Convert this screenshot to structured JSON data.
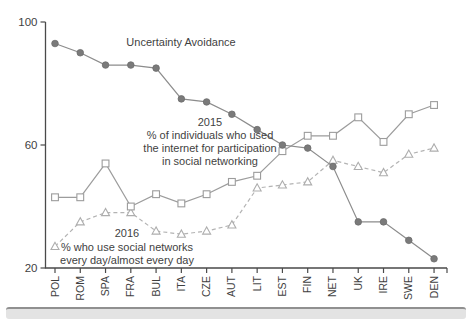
{
  "chart_data": {
    "type": "line",
    "title": "",
    "xlabel": "",
    "ylabel": "",
    "ylim": [
      20,
      100
    ],
    "yticks": [
      20,
      60,
      100
    ],
    "grid": false,
    "legend_position": "inline-annotations",
    "categories": [
      "POL",
      "ROM",
      "SPA",
      "FRA",
      "BUL",
      "ITA",
      "CZE",
      "AUT",
      "LIT",
      "EST",
      "FIN",
      "NET",
      "UK",
      "IRE",
      "SWE",
      "DEN"
    ],
    "series": [
      {
        "name": "Uncertainty Avoidance",
        "marker": "circle-filled",
        "line_style": "solid",
        "line_color": "#8c8c8c",
        "marker_color": "#7a7a7a",
        "values": [
          93,
          90,
          86,
          86,
          85,
          75,
          74,
          70,
          65,
          60,
          59,
          53,
          35,
          35,
          29,
          23
        ]
      },
      {
        "name": "2015 % of individuals who used the internet for participation in social networking",
        "marker": "square-open",
        "line_style": "solid",
        "line_color": "#9c9c9c",
        "marker_color": "#9c9c9c",
        "values": [
          43,
          43,
          54,
          40,
          44,
          41,
          44,
          48,
          50,
          58,
          63,
          63,
          69,
          61,
          70,
          73
        ]
      },
      {
        "name": "2016 % who use social networks every day/almost every day",
        "marker": "triangle-open",
        "line_style": "dashed",
        "line_color": "#b3b3b3",
        "marker_color": "#adadad",
        "values": [
          27,
          35,
          38,
          38,
          32,
          31,
          32,
          34,
          46,
          47,
          48,
          55,
          53,
          51,
          57,
          59
        ]
      }
    ],
    "annotations": [
      {
        "lines": [
          "Uncertainty Avoidance"
        ],
        "x": 181,
        "y": 46,
        "line_height": 13
      },
      {
        "lines": [
          "2015",
          "% of individuals who used",
          "the internet for participation",
          "in social networking"
        ],
        "x": 210,
        "y": 126,
        "line_height": 13
      },
      {
        "lines": [
          "2016",
          "% who use social networks",
          "every day/almost every day"
        ],
        "x": 127,
        "y": 237,
        "line_height": 13.5
      }
    ],
    "axis_color": "#4a4a4a",
    "text_color": "#3f3f3f"
  }
}
